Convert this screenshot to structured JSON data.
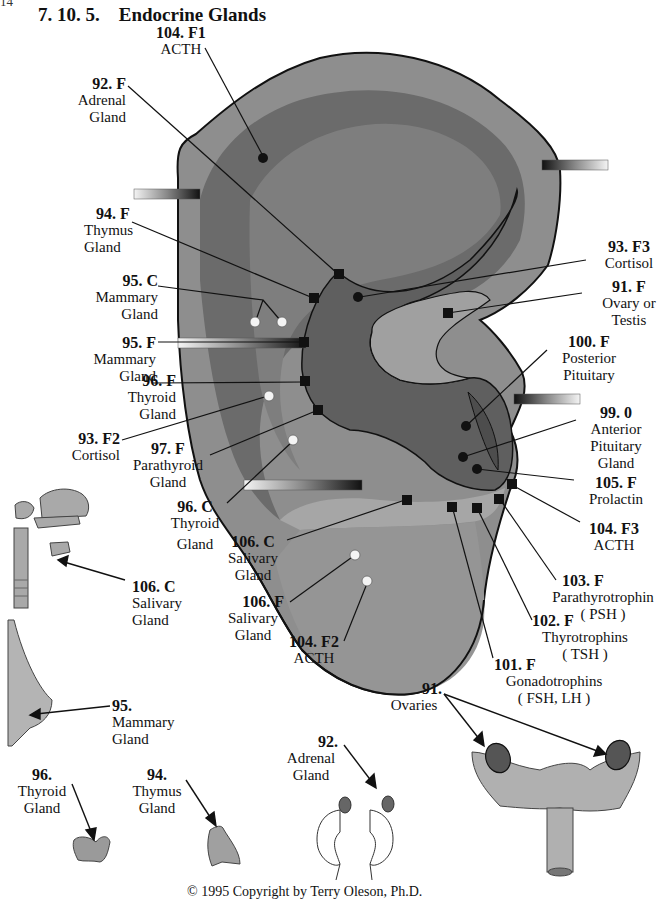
{
  "page": {
    "number_fragment": "14",
    "section_number": "7. 10. 5.",
    "section_title": "Endocrine Glands",
    "copyright": "© 1995  Copyright by Terry Oleson, Ph.D."
  },
  "colors": {
    "ear_outer": "#8c8c8c",
    "ear_light": "#9a9a9a",
    "ear_dark": "#5e5e5e",
    "concha": "#6a6a6a",
    "lobe": "#959595",
    "organ": "#a9a9a9",
    "ovary": "#555555",
    "outline": "#111111"
  },
  "ear_labels": [
    {
      "id": "104F1",
      "code": "104. F1",
      "lines": [
        "ACTH"
      ]
    },
    {
      "id": "92F",
      "code": "92. F",
      "lines": [
        "Adrenal",
        "Gland"
      ]
    },
    {
      "id": "94F",
      "code": "94. F",
      "lines": [
        "Thymus",
        "Gland"
      ]
    },
    {
      "id": "95C",
      "code": "95. C",
      "lines": [
        "Mammary",
        "Gland"
      ]
    },
    {
      "id": "95F",
      "code": "95. F",
      "lines": [
        "Mammary",
        "Gland"
      ]
    },
    {
      "id": "96F",
      "code": "96. F",
      "lines": [
        "Thyroid",
        "Gland"
      ]
    },
    {
      "id": "93F2",
      "code": "93. F2",
      "lines": [
        "Cortisol"
      ]
    },
    {
      "id": "97F",
      "code": "97. F",
      "lines": [
        "Parathyroid",
        "Gland"
      ]
    },
    {
      "id": "96C",
      "code": "96. C",
      "lines": [
        "Thyroid",
        "Gland"
      ]
    },
    {
      "id": "106C",
      "code": "106. C",
      "lines": [
        "Salivary",
        "Gland"
      ]
    },
    {
      "id": "106F",
      "code": "106. F",
      "lines": [
        "Salivary",
        "Gland"
      ]
    },
    {
      "id": "104F2",
      "code": "104. F2",
      "lines": [
        "ACTH"
      ]
    },
    {
      "id": "93F3",
      "code": "93. F3",
      "lines": [
        "Cortisol"
      ]
    },
    {
      "id": "91F",
      "code": "91. F",
      "lines": [
        "Ovary or",
        "Testis"
      ]
    },
    {
      "id": "100F",
      "code": "100. F",
      "lines": [
        "Posterior",
        "Pituitary"
      ]
    },
    {
      "id": "990",
      "code": "99. 0",
      "lines": [
        "Anterior",
        "Pituitary",
        "Gland"
      ]
    },
    {
      "id": "105F",
      "code": "105. F",
      "lines": [
        "Prolactin"
      ]
    },
    {
      "id": "104F3",
      "code": "104. F3",
      "lines": [
        "ACTH"
      ]
    },
    {
      "id": "103F",
      "code": "103. F",
      "lines": [
        "Parathyrotrophin",
        "( PSH )"
      ]
    },
    {
      "id": "102F",
      "code": "102. F",
      "lines": [
        "Thyrotrophins",
        "( TSH )"
      ]
    },
    {
      "id": "101F",
      "code": "101. F",
      "lines": [
        "Gonadotrophins",
        "( FSH, LH )"
      ]
    }
  ],
  "organ_labels": [
    {
      "id": "org106C",
      "code": "106. C",
      "lines": [
        "Salivary",
        "Gland"
      ],
      "organ": "head-neck-salivary"
    },
    {
      "id": "org95",
      "code": "95.",
      "lines": [
        "Mammary",
        "Gland"
      ],
      "organ": "breast"
    },
    {
      "id": "org96",
      "code": "96.",
      "lines": [
        "Thyroid",
        "Gland"
      ],
      "organ": "thyroid"
    },
    {
      "id": "org94",
      "code": "94.",
      "lines": [
        "Thymus",
        "Gland"
      ],
      "organ": "thymus"
    },
    {
      "id": "org92",
      "code": "92.",
      "lines": [
        "Adrenal",
        "Gland"
      ],
      "organ": "kidneys-adrenals"
    },
    {
      "id": "org91",
      "code": "91.",
      "lines": [
        "Ovaries"
      ],
      "organ": "uterus-ovaries"
    }
  ]
}
